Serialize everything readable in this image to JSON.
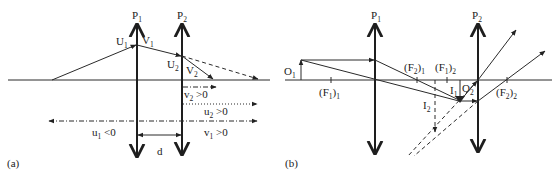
{
  "panel_a": {
    "tag": "(a)",
    "lens1": {
      "label": "P",
      "sub": "1"
    },
    "lens2": {
      "label": "P",
      "sub": "2"
    },
    "points": {
      "U1": {
        "label": "U",
        "sub": "1"
      },
      "V1": {
        "label": "V",
        "sub": "1"
      },
      "U2": {
        "label": "U",
        "sub": "2"
      },
      "V2": {
        "label": "V",
        "sub": "2"
      }
    },
    "distances": {
      "v2": {
        "label": "v",
        "sub": "2",
        "rel": " >0"
      },
      "u2": {
        "label": "u",
        "sub": "2",
        "rel": " >0"
      },
      "u1": {
        "label": "u",
        "sub": "1",
        "rel": " <0"
      },
      "v1": {
        "label": "v",
        "sub": "1",
        "rel": " >0"
      },
      "d": {
        "label": "d"
      }
    }
  },
  "panel_b": {
    "tag": "(b)",
    "lens1": {
      "label": "P",
      "sub": "1"
    },
    "lens2": {
      "label": "P",
      "sub": "2"
    },
    "object": {
      "label": "O",
      "sub": "1"
    },
    "focal_points": [
      {
        "label": "(F",
        "sub1": "1",
        "mid": ")",
        "sub2": "1"
      },
      {
        "label": "(F",
        "sub1": "2",
        "mid": ")",
        "sub2": "1"
      },
      {
        "label": "(F",
        "sub1": "1",
        "mid": ")",
        "sub2": "2"
      },
      {
        "label": "(F",
        "sub1": "2",
        "mid": ")",
        "sub2": "2"
      }
    ],
    "images": {
      "I1": {
        "label": "I",
        "sub": "1"
      },
      "O2": {
        "label": "O",
        "sub": "2"
      },
      "I2": {
        "label": "I",
        "sub": "2"
      }
    }
  },
  "colors": {
    "ink": "#222222",
    "background": "#ffffff"
  }
}
